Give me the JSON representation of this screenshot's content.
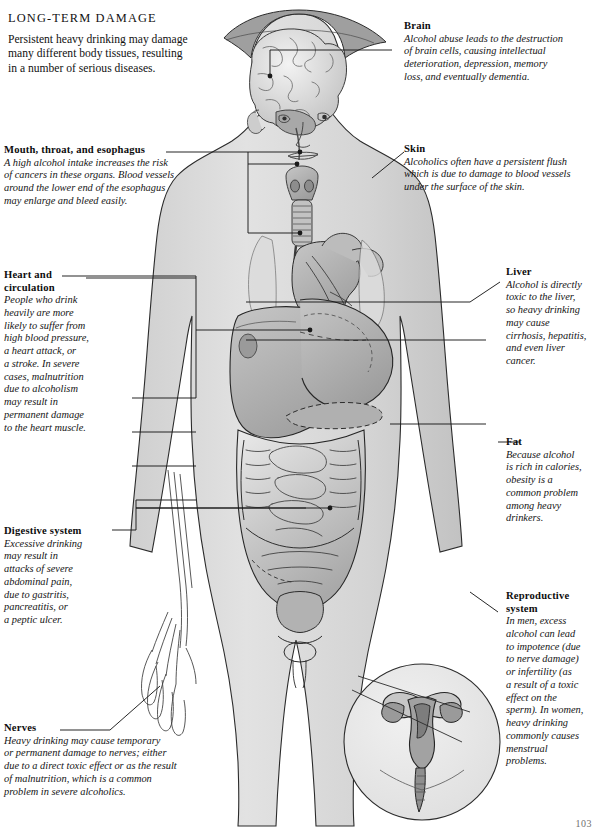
{
  "page": {
    "title": "LONG-TERM DAMAGE",
    "intro_lines": [
      "Persistent heavy drinking may damage",
      "many different body tissues, resulting",
      "in a number of serious diseases."
    ],
    "page_number": "103",
    "ink": "#111111",
    "body_fill": "#d8d8d8",
    "organ_fill": "#b4b4b4",
    "line_color": "#1a1a1a"
  },
  "illustration": {
    "name": "human-body-anatomy-figure",
    "description": "Front view of a standing human figure with cutaway showing brain, throat and esophagus, heart, liver, stomach, pancreas, intestines and reproductive organs, plus a circular inset of the female reproductive system.",
    "parts": [
      "brain",
      "skull-cutaway",
      "face",
      "larynx",
      "thyroid",
      "trachea",
      "esophagus",
      "heart",
      "lungs",
      "liver",
      "stomach",
      "pancreas",
      "small-intestine",
      "large-intestine",
      "bladder",
      "arm-nerves",
      "hand-nerves",
      "uterus-inset"
    ]
  },
  "callouts": [
    {
      "id": "brain",
      "title": [
        "Brain"
      ],
      "lines": [
        "Alcohol abuse leads to the destruction",
        "of brain cells, causing intellectual",
        "deterioration, depression, memory",
        "loss, and eventually dementia."
      ]
    },
    {
      "id": "skin",
      "title": [
        "Skin"
      ],
      "lines": [
        "Alcoholics often have a persistent flush",
        "which is due to damage to blood vessels",
        "under the surface of the skin."
      ]
    },
    {
      "id": "mouth-throat-esophagus",
      "title": [
        "Mouth, throat, and esophagus"
      ],
      "lines": [
        "A high alcohol intake increases the risk",
        "of cancers in these organs. Blood vessels",
        "around the lower end of the esophagus",
        "may enlarge and bleed easily."
      ]
    },
    {
      "id": "heart-and-circulation",
      "title": [
        "Heart and",
        "circulation"
      ],
      "lines": [
        "People who drink",
        "heavily are more",
        "likely to suffer from",
        "high blood pressure,",
        "a heart attack, or",
        "a stroke. In severe",
        "cases, malnutrition",
        "due to alcoholism",
        "may result in",
        "permanent damage",
        "to the heart muscle."
      ]
    },
    {
      "id": "digestive-system",
      "title": [
        "Digestive system"
      ],
      "lines": [
        "Excessive drinking",
        "may result in",
        "attacks of severe",
        "abdominal pain,",
        "due to gastritis,",
        "pancreatitis, or",
        "a peptic ulcer."
      ]
    },
    {
      "id": "nerves",
      "title": [
        "Nerves"
      ],
      "lines": [
        "Heavy drinking may cause temporary",
        "or permanent damage to nerves; either",
        "due to a direct toxic effect or as the result",
        "of malnutrition, which is a common",
        "problem in severe alcoholics."
      ]
    },
    {
      "id": "liver",
      "title": [
        "Liver"
      ],
      "lines": [
        "Alcohol is directly",
        "toxic to the liver,",
        "so heavy drinking",
        "may cause",
        "cirrhosis, hepatitis,",
        "and even liver",
        "cancer."
      ]
    },
    {
      "id": "fat",
      "title": [
        "Fat"
      ],
      "lines": [
        "Because alcohol",
        "is rich in calories,",
        "obesity is a",
        "common problem",
        "among heavy",
        "drinkers."
      ]
    },
    {
      "id": "reproductive-system",
      "title": [
        "Reproductive",
        "system"
      ],
      "lines": [
        "In men, excess",
        "alcohol can lead",
        "to impotence (due",
        "to nerve damage)",
        "or infertility (as",
        "a result of a toxic",
        "effect on the",
        "sperm). In women,",
        "heavy drinking",
        "commonly causes",
        "menstrual",
        "problems."
      ]
    }
  ]
}
